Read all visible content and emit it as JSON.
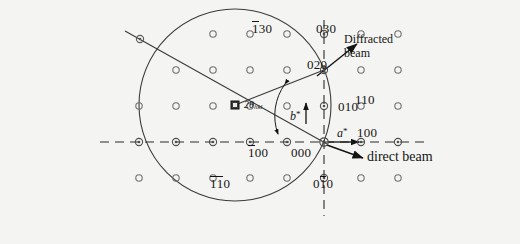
{
  "figure": {
    "kind": "ewald-sphere-reciprocal-lattice-diagram",
    "background_color": "#f4f4f2",
    "ink_color": "#141414",
    "spot_color": "#6b6b6b",
    "width": 520,
    "height": 244
  },
  "geometry": {
    "origin_000": {
      "x": 324,
      "y": 142
    },
    "lattice_spacing_a": 37,
    "lattice_spacing_b": 36,
    "ewald_center": {
      "x": 235,
      "y": 105
    },
    "ewald_radius": 96
  },
  "labels": {
    "bar130": {
      "pre": "",
      "bar": "1",
      "post": "30",
      "x": 252,
      "y": 22
    },
    "bar100": {
      "pre": "",
      "bar": "1",
      "post": "00",
      "x": 250,
      "y": 146
    },
    "bar1bar10": {
      "bar1": "1",
      "bar2": "1",
      "post": "0",
      "x": 213,
      "y": 177
    },
    "zero30": {
      "text": "030",
      "x": 318,
      "y": 22
    },
    "zero20": {
      "text": "020",
      "x": 311,
      "y": 60
    },
    "zero10": {
      "text": "010",
      "x": 338,
      "y": 103
    },
    "zero00": {
      "text": "000",
      "x": 295,
      "y": 148
    },
    "zerobar10": {
      "pre": "0",
      "bar": "1",
      "post": "0",
      "x": 315,
      "y": 177
    },
    "one10": {
      "text": "110",
      "x": 355,
      "y": 96
    },
    "one00": {
      "text": "100",
      "x": 356,
      "y": 129
    },
    "astar": {
      "text": "a",
      "superscript": "*",
      "x": 337,
      "y": 130
    },
    "bstar": {
      "text": "b",
      "superscript": "*",
      "x": 293,
      "y": 110
    },
    "two_theta": {
      "text": "2θ",
      "subscript": "hkl",
      "x": 247,
      "y": 101
    },
    "diffracted_beam_line1": {
      "text": "Diffracted",
      "x": 345,
      "y": 36
    },
    "diffracted_beam_line2": {
      "text": "beam",
      "x": 345,
      "y": 49
    },
    "direct_beam": {
      "text": "direct beam",
      "x": 367,
      "y": 150
    }
  },
  "spots": [
    {
      "h": -5,
      "k": 1,
      "x": 139,
      "y": 106,
      "on_axis": false
    },
    {
      "h": -5,
      "k": 0,
      "x": 139,
      "y": 142,
      "on_axis": true
    },
    {
      "h": -5,
      "k": -1,
      "x": 139,
      "y": 178,
      "on_axis": false
    },
    {
      "h": -4,
      "k": 2,
      "x": 176,
      "y": 70,
      "on_axis": false
    },
    {
      "h": -4,
      "k": 1,
      "x": 176,
      "y": 106,
      "on_axis": false
    },
    {
      "h": -4,
      "k": 0,
      "x": 176,
      "y": 142,
      "on_axis": true
    },
    {
      "h": -4,
      "k": -1,
      "x": 176,
      "y": 178,
      "on_axis": false
    },
    {
      "h": -3,
      "k": 3,
      "x": 213,
      "y": 34,
      "on_axis": false
    },
    {
      "h": -3,
      "k": 2,
      "x": 213,
      "y": 70,
      "on_axis": false
    },
    {
      "h": -3,
      "k": 1,
      "x": 213,
      "y": 106,
      "on_axis": false
    },
    {
      "h": -3,
      "k": 0,
      "x": 213,
      "y": 142,
      "on_axis": true
    },
    {
      "h": -3,
      "k": -1,
      "x": 213,
      "y": 178,
      "on_axis": false
    },
    {
      "h": -2,
      "k": 3,
      "x": 250,
      "y": 34,
      "on_axis": false
    },
    {
      "h": -2,
      "k": 2,
      "x": 250,
      "y": 70,
      "on_axis": false
    },
    {
      "h": -2,
      "k": 1,
      "x": 250,
      "y": 106,
      "on_axis": false
    },
    {
      "h": -2,
      "k": 0,
      "x": 250,
      "y": 142,
      "on_axis": true
    },
    {
      "h": -2,
      "k": -1,
      "x": 250,
      "y": 178,
      "on_axis": false
    },
    {
      "h": -1,
      "k": 3,
      "x": 287,
      "y": 34,
      "on_axis": false
    },
    {
      "h": -1,
      "k": 2,
      "x": 287,
      "y": 70,
      "on_axis": false
    },
    {
      "h": -1,
      "k": 1,
      "x": 287,
      "y": 106,
      "on_axis": false
    },
    {
      "h": -1,
      "k": 0,
      "x": 287,
      "y": 142,
      "on_axis": true
    },
    {
      "h": -1,
      "k": -1,
      "x": 287,
      "y": 178,
      "on_axis": false
    },
    {
      "h": 0,
      "k": 3,
      "x": 324,
      "y": 34,
      "on_axis": true
    },
    {
      "h": 0,
      "k": 2,
      "x": 324,
      "y": 70,
      "on_axis": true
    },
    {
      "h": 0,
      "k": 1,
      "x": 324,
      "y": 106,
      "on_axis": true
    },
    {
      "h": 0,
      "k": 0,
      "x": 324,
      "y": 142,
      "on_axis": true
    },
    {
      "h": 0,
      "k": -1,
      "x": 324,
      "y": 178,
      "on_axis": true
    },
    {
      "h": 1,
      "k": 3,
      "x": 361,
      "y": 34,
      "on_axis": false
    },
    {
      "h": 1,
      "k": 2,
      "x": 361,
      "y": 70,
      "on_axis": false
    },
    {
      "h": 1,
      "k": 1,
      "x": 361,
      "y": 106,
      "on_axis": false
    },
    {
      "h": 1,
      "k": 0,
      "x": 361,
      "y": 142,
      "on_axis": true
    },
    {
      "h": 1,
      "k": -1,
      "x": 361,
      "y": 178,
      "on_axis": false
    },
    {
      "h": 2,
      "k": 3,
      "x": 398,
      "y": 34,
      "on_axis": false
    },
    {
      "h": 2,
      "k": 2,
      "x": 398,
      "y": 70,
      "on_axis": false
    },
    {
      "h": 2,
      "k": 1,
      "x": 398,
      "y": 106,
      "on_axis": false
    },
    {
      "h": 2,
      "k": 0,
      "x": 398,
      "y": 142,
      "on_axis": true
    },
    {
      "h": 2,
      "k": -1,
      "x": 398,
      "y": 178,
      "on_axis": false
    }
  ],
  "lines": {
    "incident_beam": {
      "x1": 125,
      "y1": 31,
      "x2": 324,
      "y2": 142
    },
    "incident_beam_spot": {
      "x": 140,
      "y": 39
    },
    "diffracted_radius": {
      "x1": 235,
      "y1": 105,
      "x2": 324,
      "y2": 70
    },
    "horizontal_dashed": {
      "x1": 100,
      "y1": 142,
      "x2": 430,
      "y2": 142
    },
    "vertical_dashed": {
      "x1": 324,
      "y1": 20,
      "x2": 324,
      "y2": 215
    },
    "diffracted_arrow": {
      "x1": 318,
      "y1": 75,
      "x2": 357,
      "y2": 44
    },
    "direct_arrow": {
      "x1": 328,
      "y1": 146,
      "x2": 362,
      "y2": 157
    },
    "astar_arrow": {
      "x1": 327,
      "y1": 142,
      "x2": 358,
      "y2": 142
    },
    "bstar_arrow": {
      "x1": 305,
      "y1": 122,
      "x2": 305,
      "y2": 104
    }
  }
}
